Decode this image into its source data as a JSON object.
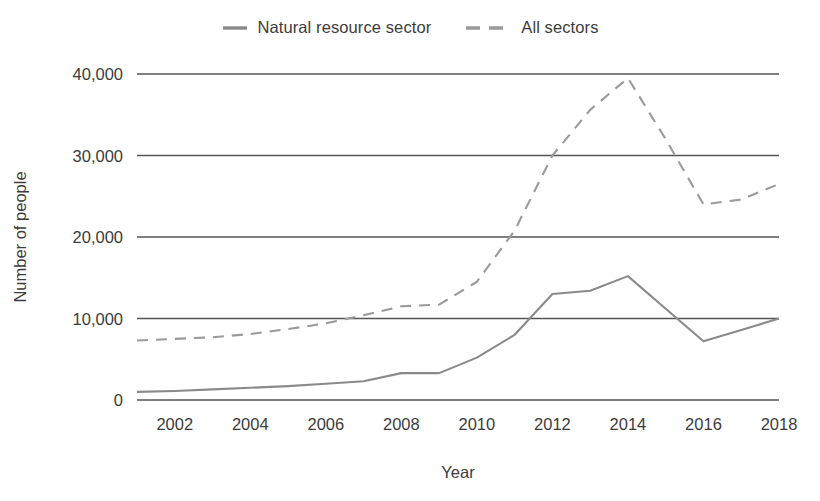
{
  "chart_data": {
    "type": "line",
    "title": "",
    "xlabel": "Year",
    "ylabel": "Number of people",
    "xlim": [
      2001,
      2018
    ],
    "ylim": [
      0,
      40000
    ],
    "grid": true,
    "legend_position": "top-center",
    "x": [
      2001,
      2002,
      2003,
      2004,
      2005,
      2006,
      2007,
      2008,
      2009,
      2010,
      2011,
      2012,
      2013,
      2014,
      2015,
      2016,
      2017,
      2018
    ],
    "xticks": [
      "2002",
      "2004",
      "2006",
      "2008",
      "2010",
      "2012",
      "2014",
      "2016",
      "2018"
    ],
    "xtick_values": [
      2002,
      2004,
      2006,
      2008,
      2010,
      2012,
      2014,
      2016,
      2018
    ],
    "yticks": [
      "0",
      "10,000",
      "20,000",
      "30,000",
      "40,000"
    ],
    "ytick_values": [
      0,
      10000,
      20000,
      30000,
      40000
    ],
    "series": [
      {
        "name": "Natural resource sector",
        "style": "solid",
        "color": "#8a8a8a",
        "values": [
          1000,
          1100,
          1300,
          1500,
          1700,
          2000,
          2300,
          3300,
          3300,
          5200,
          8000,
          13000,
          13400,
          15200,
          11200,
          7200,
          8600,
          10000
        ]
      },
      {
        "name": "All sectors",
        "style": "dashed",
        "color": "#9a9a9a",
        "values": [
          7300,
          7500,
          7700,
          8100,
          8700,
          9400,
          10400,
          11500,
          11700,
          14500,
          20800,
          30000,
          35600,
          39500,
          32000,
          24000,
          24600,
          26500
        ]
      }
    ]
  },
  "legend": {
    "items": [
      {
        "label": "Natural resource sector",
        "style": "solid",
        "color": "#8a8a8a"
      },
      {
        "label": "All sectors",
        "style": "dashed",
        "color": "#9a9a9a"
      }
    ]
  },
  "axes": {
    "y_title": "Number of people",
    "x_title": "Year"
  },
  "colors": {
    "natural_resource_sector": "#8a8a8a",
    "all_sectors": "#9a9a9a",
    "gridline": "#555555",
    "text": "#3c3c3c",
    "background": "#ffffff"
  }
}
